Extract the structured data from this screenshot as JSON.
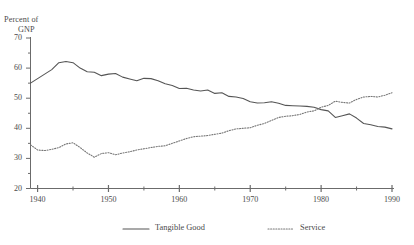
{
  "chart_data": {
    "type": "line",
    "title": "",
    "xlabel": "",
    "ylabel": "Percent of GNP",
    "ylabel_lines": [
      "Percent of",
      "GNP"
    ],
    "xlim": [
      1939,
      1990
    ],
    "ylim": [
      20,
      70
    ],
    "ytick_values": [
      70,
      60,
      50,
      40,
      30,
      20
    ],
    "ytick_labels": [
      "70",
      "60",
      "50",
      "40",
      "30",
      "20"
    ],
    "yminor_step": 5,
    "xtick_values": [
      1940,
      1950,
      1960,
      1970,
      1980,
      1990
    ],
    "xtick_labels": [
      "1940",
      "1950",
      "1960",
      "1970",
      "1980",
      "1990"
    ],
    "xminor_values": [
      1945,
      1955,
      1965,
      1975,
      1985
    ],
    "grid": false,
    "legend_position": "bottom",
    "x": [
      1939,
      1940,
      1941,
      1942,
      1943,
      1944,
      1945,
      1946,
      1947,
      1948,
      1949,
      1950,
      1951,
      1952,
      1953,
      1954,
      1955,
      1956,
      1957,
      1958,
      1959,
      1960,
      1961,
      1962,
      1963,
      1964,
      1965,
      1966,
      1967,
      1968,
      1969,
      1970,
      1971,
      1972,
      1973,
      1974,
      1975,
      1976,
      1977,
      1978,
      1979,
      1980,
      1981,
      1982,
      1983,
      1984,
      1985,
      1986,
      1987,
      1988,
      1989,
      1990
    ],
    "series": [
      {
        "name": "Tangible Good",
        "style": "solid",
        "color": "#555555",
        "values": [
          55.0,
          56.5,
          58.0,
          59.5,
          61.8,
          62.2,
          61.8,
          60.0,
          58.8,
          58.6,
          57.5,
          58.0,
          58.2,
          57.0,
          56.4,
          55.8,
          56.6,
          56.5,
          55.8,
          54.8,
          54.2,
          53.2,
          53.3,
          52.7,
          52.4,
          52.7,
          51.6,
          51.8,
          50.6,
          50.4,
          49.9,
          48.8,
          48.4,
          48.5,
          48.8,
          48.3,
          47.6,
          47.5,
          47.4,
          47.3,
          47.0,
          46.2,
          45.8,
          43.6,
          44.2,
          44.8,
          43.4,
          41.6,
          41.2,
          40.6,
          40.4,
          39.8
        ]
      },
      {
        "name": "Service",
        "style": "dotted",
        "color": "#777777",
        "values": [
          34.5,
          32.8,
          32.6,
          33.0,
          33.6,
          34.8,
          35.2,
          33.6,
          31.8,
          30.4,
          31.6,
          31.9,
          31.2,
          31.8,
          32.2,
          32.8,
          33.2,
          33.6,
          34.0,
          34.2,
          35.0,
          35.8,
          36.6,
          37.2,
          37.4,
          37.6,
          38.0,
          38.4,
          39.2,
          39.8,
          40.0,
          40.2,
          41.0,
          41.6,
          42.6,
          43.6,
          44.0,
          44.2,
          44.6,
          45.4,
          45.8,
          47.0,
          47.6,
          49.0,
          48.6,
          48.4,
          49.6,
          50.4,
          50.6,
          50.4,
          51.0,
          51.8
        ]
      }
    ],
    "legend": [
      {
        "label": "Tangible Good",
        "style": "solid"
      },
      {
        "label": "Service",
        "style": "dotted"
      }
    ]
  },
  "axis": {
    "y_title_line1": "Percent of",
    "y_title_line2": "GNP"
  },
  "colors": {
    "axis": "#6b6b6b",
    "line_solid": "#555555",
    "line_dotted": "#808080",
    "text": "#4a4a4a",
    "background": "#ffffff"
  }
}
